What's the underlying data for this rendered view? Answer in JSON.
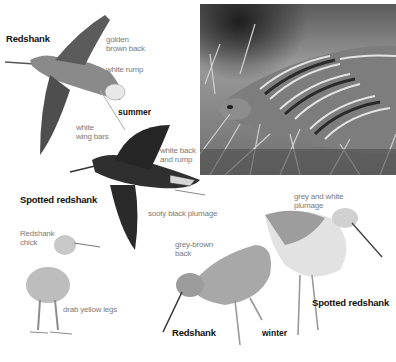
{
  "figure": {
    "colors": {
      "background": "#ffffff",
      "title_text": "#111111",
      "annotation_text": "#7a7a7a"
    }
  },
  "photo": {
    "subject": "close-up photograph of a brooding wader among grass"
  },
  "summer": {
    "season_label": "summer",
    "redshank": {
      "title": "Redshank",
      "annotations": [
        "golden\nbrown back",
        "white rump",
        "white\nwing bars"
      ]
    },
    "spotted_redshank": {
      "title": "Spotted redshank",
      "annotations": [
        "white back\nand rump",
        "sooty black plumage"
      ]
    }
  },
  "chick": {
    "title": "Redshank\nchick",
    "annotations": [
      "drab yellow legs"
    ]
  },
  "winter": {
    "season_label": "winter",
    "redshank": {
      "title": "Redshank",
      "annotations": [
        "grey-brown\nback"
      ]
    },
    "spotted_redshank": {
      "title": "Spotted redshank",
      "annotations": [
        "grey and white\nplumage"
      ]
    }
  }
}
